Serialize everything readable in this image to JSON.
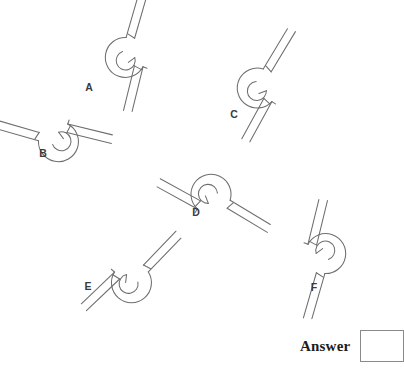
{
  "figure": {
    "type": "line-drawing-puzzle",
    "stroke_color": "#6e6e6e",
    "background_color": "#ffffff",
    "label_color": "#3a3a3a",
    "shapes": [
      {
        "id": "A",
        "label": "A",
        "label_x": 89,
        "label_y": 91,
        "cx": 127,
        "cy": 57,
        "rotation": -35,
        "mirrored": false
      },
      {
        "id": "B",
        "label": "B",
        "label_x": 43,
        "label_y": 157,
        "cx": 58,
        "cy": 140,
        "rotation": -125,
        "mirrored": false
      },
      {
        "id": "C",
        "label": "C",
        "label_x": 234,
        "label_y": 118,
        "cx": 259,
        "cy": 88,
        "rotation": -20,
        "mirrored": false
      },
      {
        "id": "D",
        "label": "D",
        "label_x": 196,
        "label_y": 216,
        "cx": 211,
        "cy": 196,
        "rotation": 70,
        "mirrored": false
      },
      {
        "id": "E",
        "label": "E",
        "label_x": 88,
        "label_y": 290,
        "cx": 131,
        "cy": 281,
        "rotation": 95,
        "mirrored": true
      },
      {
        "id": "F",
        "label": "F",
        "label_x": 314,
        "label_y": 291,
        "cx": 324,
        "cy": 254,
        "rotation": 145,
        "mirrored": false
      }
    ]
  },
  "answer": {
    "label": "Answer",
    "value": "",
    "box_placeholder": ""
  }
}
